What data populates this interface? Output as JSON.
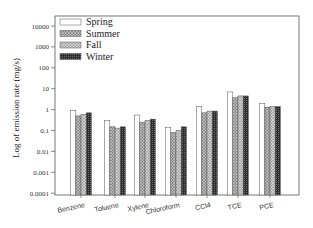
{
  "chart_data": {
    "type": "bar",
    "title": "",
    "xlabel": "",
    "ylabel": "Log of emission rate (mg/s)",
    "yscale": "log",
    "ylim": [
      0.0001,
      10000
    ],
    "yticks": [
      0.0001,
      0.001,
      0.01,
      0.1,
      1,
      10,
      100,
      1000,
      10000
    ],
    "ytick_labels": [
      "0.0001",
      "0.001",
      "0.01",
      "0.1",
      "1",
      "10",
      "100",
      "1000",
      "10000"
    ],
    "categories": [
      "Benzene",
      "Toluene",
      "Xylene",
      "Chloroform",
      "CCl4",
      "TCE",
      "PCE"
    ],
    "series": [
      {
        "name": "Spring",
        "values": [
          0.9,
          0.3,
          0.55,
          0.14,
          1.4,
          7.0,
          2.0
        ]
      },
      {
        "name": "Summer",
        "values": [
          0.5,
          0.15,
          0.25,
          0.08,
          0.7,
          3.7,
          1.3
        ]
      },
      {
        "name": "Fall",
        "values": [
          0.6,
          0.13,
          0.3,
          0.1,
          0.85,
          4.5,
          1.4
        ]
      },
      {
        "name": "Winter",
        "values": [
          0.7,
          0.15,
          0.35,
          0.15,
          0.85,
          4.5,
          1.4
        ]
      }
    ],
    "legend": {
      "position": "upper-left",
      "entries": [
        "Spring",
        "Summer",
        "Fall",
        "Winter"
      ]
    },
    "grid": false
  },
  "style": {
    "series_fills": [
      "#ffffff",
      "#9a9a9a",
      "#b0b0b0",
      "#3a3a3a"
    ],
    "series_patterns": [
      "none",
      "crosshatch",
      "crosshatch",
      "dense"
    ],
    "axis_color": "#555555"
  }
}
